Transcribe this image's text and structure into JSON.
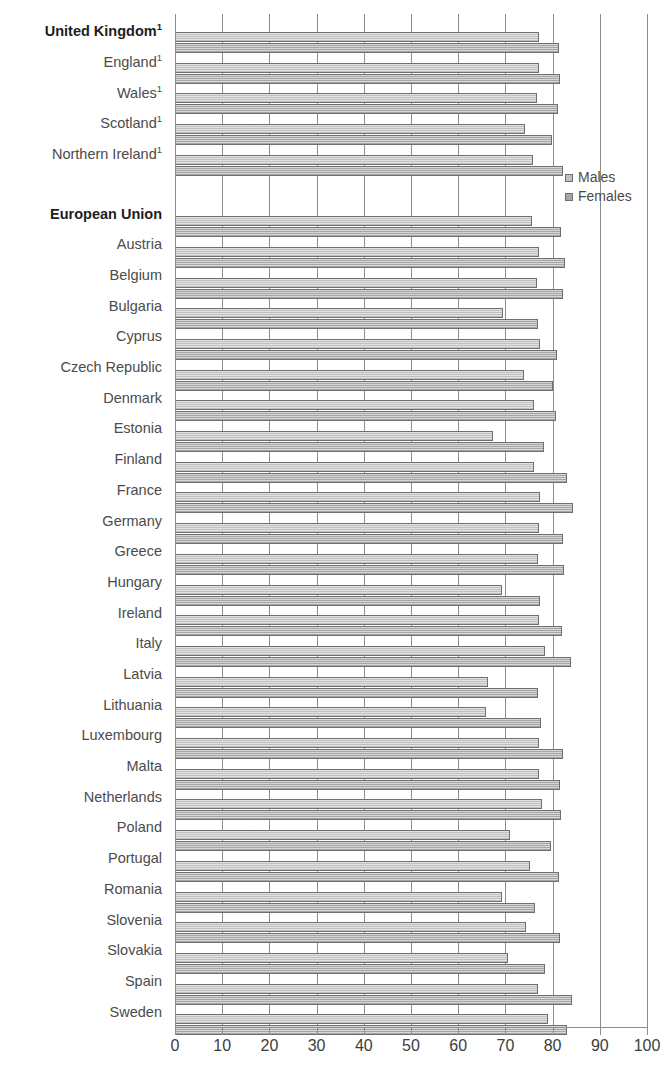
{
  "chart_data": {
    "type": "bar",
    "orientation": "horizontal",
    "title": "",
    "xlabel": "",
    "ylabel": "",
    "xlim": [
      0,
      100
    ],
    "xticks": [
      0,
      10,
      20,
      30,
      40,
      50,
      60,
      70,
      80,
      90,
      100
    ],
    "xtick_labels": [
      "0",
      "10",
      "20",
      "30",
      "40",
      "50",
      "60",
      "70",
      "80",
      "90",
      "100"
    ],
    "grid": true,
    "legend_position": "right-top",
    "categories": [
      "United Kingdom¹",
      "England¹",
      "Wales¹",
      "Scotland¹",
      "Northern Ireland¹",
      "",
      "European Union",
      "Austria",
      "Belgium",
      "Bulgaria",
      "Cyprus",
      "Czech Republic",
      "Denmark",
      "Estonia",
      "Finland",
      "France",
      "Germany",
      "Greece",
      "Hungary",
      "Ireland",
      "Italy",
      "Latvia",
      "Lithuania",
      "Luxembourg",
      "Malta",
      "Netherlands",
      "Poland",
      "Portugal",
      "Romania",
      "Slovenia",
      "Slovakia",
      "Spain",
      "Sweden"
    ],
    "series": [
      {
        "name": "Males",
        "color": "#c0c0c0",
        "values": [
          77.1,
          77.2,
          76.6,
          74.2,
          75.8,
          null,
          75.6,
          77.1,
          76.6,
          69.5,
          77.4,
          74.0,
          76.1,
          67.4,
          76.0,
          77.3,
          77.2,
          77.0,
          69.2,
          77.1,
          78.3,
          66.3,
          65.9,
          77.1,
          77.1,
          77.8,
          70.9,
          75.2,
          69.2,
          74.3,
          70.5,
          76.9,
          79.0
        ]
      },
      {
        "name": "Females",
        "color": "#a6a6a6",
        "values": [
          81.4,
          81.5,
          81.1,
          79.9,
          82.2,
          null,
          81.8,
          82.7,
          82.1,
          76.9,
          81.0,
          80.1,
          80.7,
          78.2,
          83.0,
          84.3,
          82.3,
          82.4,
          77.4,
          81.9,
          83.8,
          76.9,
          77.5,
          82.2,
          81.5,
          81.7,
          79.7,
          81.4,
          76.3,
          81.5,
          78.4,
          84.1,
          83.1
        ]
      }
    ]
  },
  "legend": {
    "items": [
      {
        "label": "Males",
        "swatch": "males"
      },
      {
        "label": "Females",
        "swatch": "females"
      }
    ]
  },
  "bold_categories": [
    "United Kingdom¹",
    "European Union"
  ]
}
